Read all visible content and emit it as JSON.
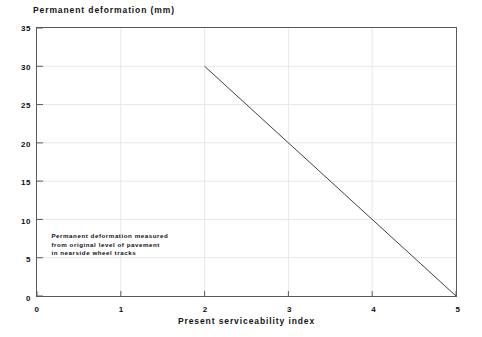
{
  "chart_data": {
    "type": "line",
    "title": "Permanent deformation (mm)",
    "xlabel": "Present serviceability index",
    "ylabel": "Permanent deformation (mm)",
    "xlim": [
      0,
      5
    ],
    "ylim": [
      0,
      35
    ],
    "xticks": [
      "0",
      "1",
      "2",
      "3",
      "4",
      "5"
    ],
    "yticks": [
      "0",
      "5",
      "10",
      "15",
      "20",
      "25",
      "30",
      "35"
    ],
    "grid": true,
    "legend": "none",
    "series": [
      {
        "name": "Permanent deformation",
        "x": [
          2,
          5
        ],
        "values": [
          30,
          0
        ],
        "color": "#404040"
      }
    ],
    "annotations": [
      {
        "name": "measurement-note",
        "line1": "Permanent deformation measured",
        "line2": "from original level of pavement",
        "line3": "in nearside wheel tracks",
        "x": 0.1,
        "y": 8
      }
    ]
  },
  "style": {
    "grid_color": "#e8e8e8",
    "axis_color": "#5a5a5a",
    "line_color": "#404040",
    "text_color": "#101010",
    "background": "#ffffff"
  }
}
